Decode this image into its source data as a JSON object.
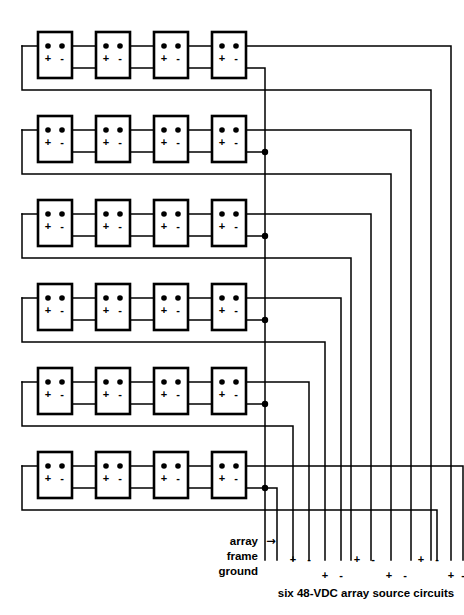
{
  "diagram": {
    "type": "electrical-wiring-schematic",
    "canvas": {
      "width": 464,
      "height": 615
    },
    "line_color": "#000000",
    "background_color": "#ffffff",
    "rows": 6,
    "modules_per_row": 4,
    "module_polarity": {
      "positive": "+",
      "negative": "-"
    },
    "geometry": {
      "module_width": 34,
      "module_height": 46,
      "module_x_positions": [
        38,
        96,
        154,
        212
      ],
      "row_top_positions": [
        32,
        116,
        200,
        284,
        368,
        452
      ],
      "terminal_row_offset": 14,
      "polarity_row_offset": 26,
      "ground_bus_x": 265,
      "left_return_x": 22,
      "right_bus_x_positions": [
        451,
        431,
        411,
        391,
        371,
        351
      ],
      "lead_x_positions": [
        293,
        309,
        325,
        341,
        357,
        373,
        389,
        405,
        421,
        437,
        453,
        463
      ],
      "lead_bottom_y": 560
    }
  },
  "labels": {
    "ground": {
      "line1": "array",
      "line2": "frame",
      "line3": "ground",
      "arrow": "→"
    },
    "caption": "six 48-VDC array source circuits",
    "circuit_polarity_pairs": [
      {
        "positive": "+",
        "negative": "-",
        "row": "upper"
      },
      {
        "positive": "+",
        "negative": "-",
        "row": "lower"
      },
      {
        "positive": "+",
        "negative": "-",
        "row": "upper"
      },
      {
        "positive": "+",
        "negative": "-",
        "row": "lower"
      },
      {
        "positive": "+",
        "negative": "-",
        "row": "upper"
      },
      {
        "positive": "+",
        "negative": "-",
        "row": "lower"
      }
    ]
  },
  "modules": {
    "row_labels": [
      "row-1",
      "row-2",
      "row-3",
      "row-4",
      "row-5",
      "row-6"
    ],
    "column_labels": [
      "module-1",
      "module-2",
      "module-3",
      "module-4"
    ],
    "terminal_marks": {
      "plus": "+",
      "minus": "-"
    }
  }
}
